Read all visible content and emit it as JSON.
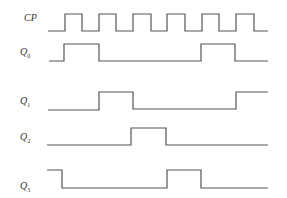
{
  "diagram": {
    "type": "timing-diagram",
    "stroke_color": "#555555",
    "signals": [
      {
        "name": "CP",
        "base": "",
        "sub": "",
        "label_y": 18,
        "high_y": 14,
        "low_y": 31,
        "points": [
          [
            48,
            31
          ],
          [
            65,
            31
          ],
          [
            65,
            14
          ],
          [
            82,
            14
          ],
          [
            82,
            31
          ],
          [
            99,
            31
          ],
          [
            99,
            14
          ],
          [
            116,
            14
          ],
          [
            116,
            31
          ],
          [
            133,
            31
          ],
          [
            133,
            14
          ],
          [
            151,
            14
          ],
          [
            151,
            31
          ],
          [
            167,
            31
          ],
          [
            167,
            14
          ],
          [
            185,
            14
          ],
          [
            185,
            31
          ],
          [
            202,
            31
          ],
          [
            202,
            14
          ],
          [
            219,
            14
          ],
          [
            219,
            31
          ],
          [
            236,
            31
          ],
          [
            236,
            14
          ],
          [
            254,
            14
          ],
          [
            254,
            31
          ],
          [
            268,
            31
          ]
        ]
      },
      {
        "name": "Q0",
        "base": "Q",
        "sub": "0",
        "label_y": 51,
        "high_y": 44,
        "low_y": 61,
        "points": [
          [
            49,
            61
          ],
          [
            64,
            61
          ],
          [
            64,
            44
          ],
          [
            99,
            44
          ],
          [
            99,
            61
          ],
          [
            201,
            61
          ],
          [
            201,
            44
          ],
          [
            235,
            44
          ],
          [
            235,
            61
          ],
          [
            268,
            61
          ]
        ]
      },
      {
        "name": "Q1",
        "base": "Q",
        "sub": "1",
        "label_y": 100,
        "high_y": 92,
        "low_y": 110,
        "points": [
          [
            48,
            110
          ],
          [
            99,
            110
          ],
          [
            99,
            92
          ],
          [
            133,
            92
          ],
          [
            133,
            109
          ],
          [
            236,
            109
          ],
          [
            236,
            92
          ],
          [
            268,
            92
          ]
        ]
      },
      {
        "name": "Q2",
        "base": "Q",
        "sub": "2",
        "label_y": 136,
        "high_y": 128,
        "low_y": 145,
        "points": [
          [
            47,
            145
          ],
          [
            131,
            145
          ],
          [
            131,
            128
          ],
          [
            166,
            128
          ],
          [
            166,
            145
          ],
          [
            268,
            145
          ]
        ]
      },
      {
        "name": "Q3",
        "base": "Q",
        "sub": "3",
        "label_y": 185,
        "high_y": 170,
        "low_y": 188,
        "points": [
          [
            47,
            170
          ],
          [
            62,
            170
          ],
          [
            62,
            188
          ],
          [
            167,
            188
          ],
          [
            167,
            170
          ],
          [
            201,
            170
          ],
          [
            201,
            188
          ],
          [
            268,
            188
          ]
        ]
      }
    ]
  }
}
